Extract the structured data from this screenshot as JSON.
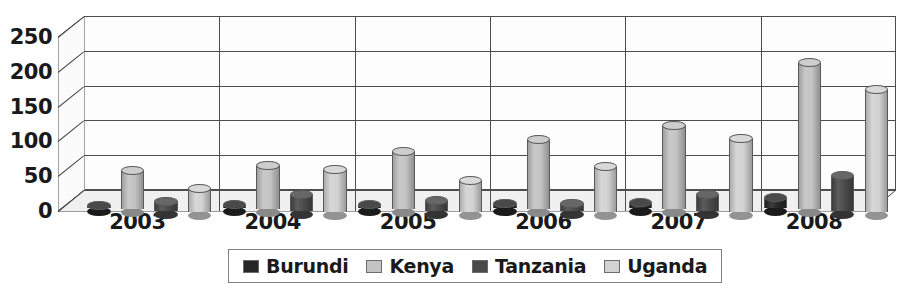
{
  "chart_data": {
    "type": "bar",
    "title": "",
    "subtitle": "",
    "xlabel": "",
    "ylabel": "",
    "categories": [
      "2003",
      "2004",
      "2005",
      "2006",
      "2007",
      "2008"
    ],
    "series": [
      {
        "name": "Burundi",
        "color": "#262626",
        "values": [
          3,
          5,
          5,
          6,
          8,
          15
        ]
      },
      {
        "name": "Kenya",
        "color": "#c3c3c3",
        "values": [
          55,
          62,
          82,
          100,
          120,
          210
        ]
      },
      {
        "name": "Tanzania",
        "color": "#4a4a4a",
        "values": [
          13,
          22,
          14,
          10,
          22,
          50
        ]
      },
      {
        "name": "Uganda",
        "color": "#d2d2d2",
        "values": [
          33,
          60,
          45,
          65,
          105,
          175
        ]
      }
    ],
    "ylim": [
      0,
      250
    ],
    "ytick_values": [
      0,
      50,
      100,
      150,
      200,
      250
    ],
    "ytick_labels": [
      "0",
      "50",
      "100",
      "150",
      "200",
      "250"
    ],
    "grid": true,
    "legend_position": "bottom",
    "style": "3d-cylinder"
  },
  "axes": {
    "y_labels": [
      "250",
      "200",
      "150",
      "100",
      "50",
      "0"
    ],
    "x_labels": [
      "2003",
      "2004",
      "2005",
      "2006",
      "2007",
      "2008"
    ]
  },
  "legend": {
    "items": [
      {
        "label": "Burundi",
        "color": "#262626"
      },
      {
        "label": "Kenya",
        "color": "#c3c3c3"
      },
      {
        "label": "Tanzania",
        "color": "#4a4a4a"
      },
      {
        "label": "Uganda",
        "color": "#d2d2d2"
      }
    ]
  }
}
